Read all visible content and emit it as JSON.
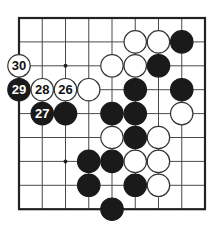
{
  "diagram": {
    "type": "go-board-fragment",
    "columns": 9,
    "rows": 9,
    "edges": {
      "top": true,
      "right": true,
      "bottom": true,
      "left": true
    },
    "geometry": {
      "x0": 19,
      "y0": 18,
      "dx": 23.25,
      "dy": 23.9,
      "stone_radius": 11.2
    },
    "colors": {
      "line": "#4a4a4a",
      "border": "#222222",
      "black": "#1a1a1a",
      "white": "#ffffff",
      "stone_outline": "#333333"
    },
    "hoshi": [
      {
        "col": 2,
        "row": 2
      },
      {
        "col": 2,
        "row": 6
      }
    ],
    "stones": [
      {
        "col": 5,
        "row": 1,
        "color": "white"
      },
      {
        "col": 6,
        "row": 1,
        "color": "white"
      },
      {
        "col": 7,
        "row": 1,
        "color": "black"
      },
      {
        "col": 0,
        "row": 2,
        "color": "white",
        "label": "30"
      },
      {
        "col": 4,
        "row": 2,
        "color": "white"
      },
      {
        "col": 5,
        "row": 2,
        "color": "white"
      },
      {
        "col": 6,
        "row": 2,
        "color": "black"
      },
      {
        "col": 0,
        "row": 3,
        "color": "black",
        "label": "29"
      },
      {
        "col": 1,
        "row": 3,
        "color": "white",
        "label": "28"
      },
      {
        "col": 2,
        "row": 3,
        "color": "white",
        "label": "26"
      },
      {
        "col": 3,
        "row": 3,
        "color": "white"
      },
      {
        "col": 5,
        "row": 3,
        "color": "black"
      },
      {
        "col": 7,
        "row": 3,
        "color": "black"
      },
      {
        "col": 1,
        "row": 4,
        "color": "black",
        "label": "27"
      },
      {
        "col": 2,
        "row": 4,
        "color": "black"
      },
      {
        "col": 4,
        "row": 4,
        "color": "black"
      },
      {
        "col": 5,
        "row": 4,
        "color": "black"
      },
      {
        "col": 7,
        "row": 4,
        "color": "white"
      },
      {
        "col": 4,
        "row": 5,
        "color": "white"
      },
      {
        "col": 5,
        "row": 5,
        "color": "black"
      },
      {
        "col": 6,
        "row": 5,
        "color": "white"
      },
      {
        "col": 3,
        "row": 6,
        "color": "black"
      },
      {
        "col": 4,
        "row": 6,
        "color": "black"
      },
      {
        "col": 5,
        "row": 6,
        "color": "white"
      },
      {
        "col": 6,
        "row": 6,
        "color": "white"
      },
      {
        "col": 3,
        "row": 7,
        "color": "black"
      },
      {
        "col": 5,
        "row": 7,
        "color": "black"
      },
      {
        "col": 6,
        "row": 7,
        "color": "white"
      },
      {
        "col": 4,
        "row": 8,
        "color": "black"
      }
    ]
  }
}
